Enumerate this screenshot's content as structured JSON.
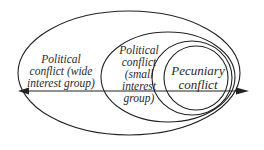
{
  "diagram": {
    "type": "nested-ellipses",
    "stroke_color": "#222222",
    "background": "#ffffff",
    "regions": [
      {
        "id": "wide",
        "lines": [
          "Political",
          "conflict (wide",
          "interest group)"
        ]
      },
      {
        "id": "small",
        "lines": [
          "Political",
          "conflict",
          "(small",
          "interest",
          "group)"
        ]
      },
      {
        "id": "pecuniary",
        "lines": [
          "Pecuniary",
          "conflict"
        ]
      }
    ],
    "axis": {
      "direction": "bidirectional",
      "description": "horizontal double-headed arrow through all regions"
    }
  }
}
